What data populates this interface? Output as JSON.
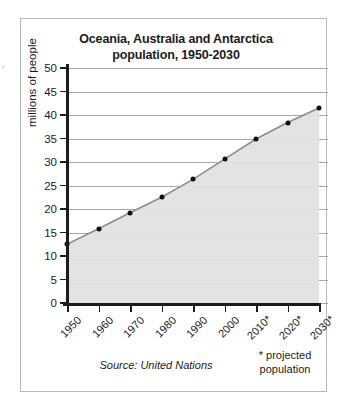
{
  "figure": {
    "title_line1": "Oceania, Australia and Antarctica",
    "title_line2": "population, 1950-2030",
    "source_note": "Source: United Nations",
    "projection_note_line1": "* projected",
    "projection_note_line2": "population",
    "edge_artifact": "r",
    "border_color": "#b8b8b8",
    "background": "#ffffff"
  },
  "chart_data": {
    "type": "area",
    "title": "Oceania, Australia and Antarctica population, 1950-2030",
    "xlabel": "",
    "ylabel": "millions of people",
    "categories": [
      "1950",
      "1960",
      "1970",
      "1980",
      "1990",
      "2000",
      "2010*",
      "2020*",
      "2030*"
    ],
    "values": [
      12.5,
      15.8,
      19.2,
      22.5,
      26.3,
      30.6,
      34.9,
      38.4,
      41.5
    ],
    "ylim": [
      0,
      50
    ],
    "yticks": [
      0,
      5,
      10,
      15,
      20,
      25,
      30,
      35,
      40,
      45,
      50
    ],
    "ytick_labels": [
      "0",
      "5",
      "10",
      "15",
      "20",
      "25",
      "30",
      "35",
      "40",
      "45",
      "50"
    ],
    "grid": true,
    "legend": null,
    "series": [
      {
        "name": "population",
        "values": [
          12.5,
          15.8,
          19.2,
          22.5,
          26.3,
          30.6,
          34.9,
          38.4,
          41.5
        ],
        "line_color": "#8c8c8c",
        "marker_color": "#111111",
        "fill_color": "#e2e2e2"
      }
    ],
    "annotations": [
      "* projected population",
      "Source: United Nations"
    ],
    "gridline_color": "#a8a8a8",
    "axis_color": "#1c1c1c"
  }
}
